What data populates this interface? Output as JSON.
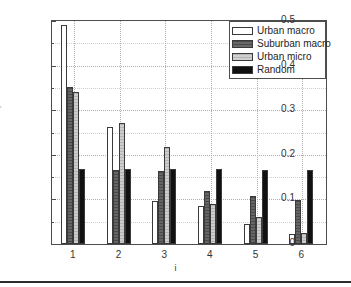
{
  "chart_data": {
    "type": "bar",
    "title": "",
    "xlabel": "i",
    "ylabel": "Eigenvalues λ",
    "ylabel_sub": "i",
    "categories": [
      "1",
      "2",
      "3",
      "4",
      "5",
      "6"
    ],
    "ylim": [
      0,
      0.5
    ],
    "ytick_labels": [
      "0",
      "0.1",
      "0.2",
      "0.3",
      "0.4",
      "0.5"
    ],
    "ytick_values": [
      0,
      0.1,
      0.2,
      0.3,
      0.4,
      0.5
    ],
    "yminor_values": [
      0.05,
      0.15,
      0.25,
      0.35,
      0.45
    ],
    "grid": true,
    "legend_position": "top-right",
    "series": [
      {
        "name": "Urban macro",
        "color": "#ffffff",
        "values": [
          0.491,
          0.263,
          0.096,
          0.086,
          0.044,
          0.022
        ]
      },
      {
        "name": "Suburban macro",
        "color": "#595959",
        "values": [
          0.352,
          0.167,
          0.163,
          0.119,
          0.107,
          0.099
        ]
      },
      {
        "name": "Urban micro",
        "color": "#c4c4c4",
        "values": [
          0.341,
          0.272,
          0.218,
          0.089,
          0.061,
          0.025
        ]
      },
      {
        "name": "Random",
        "color": "#111111",
        "values": [
          0.169,
          0.168,
          0.168,
          0.168,
          0.167,
          0.167
        ]
      }
    ]
  }
}
